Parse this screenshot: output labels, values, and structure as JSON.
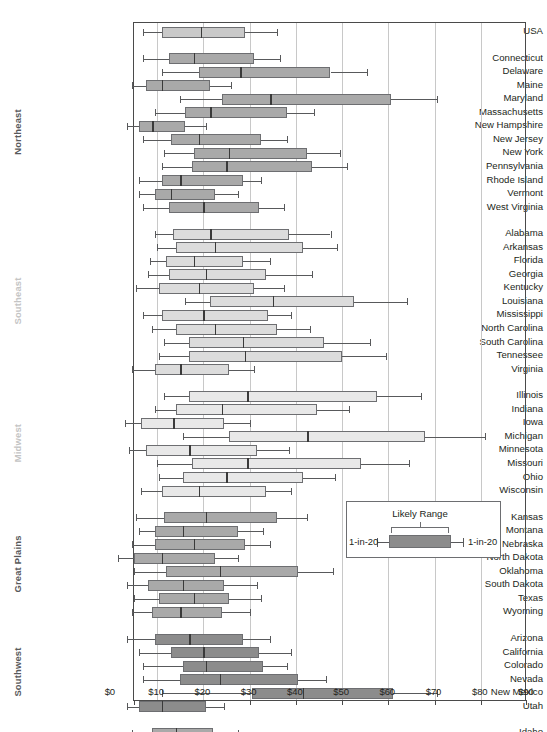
{
  "chart_data": {
    "type": "box",
    "title": "",
    "xlabel": "",
    "ylabel": "",
    "xlim": [
      0,
      90
    ],
    "xtick_labels": [
      "$0",
      "$10",
      "$20",
      "$30",
      "$40",
      "$50",
      "$60",
      "$70",
      "$80",
      "$90"
    ],
    "xtick_values": [
      0,
      10,
      20,
      30,
      40,
      50,
      60,
      70,
      80,
      90
    ],
    "grid": "vertical",
    "legend_position": "inside-right",
    "box_parts": [
      "1-in-20 low whisker",
      "Likely Range box",
      "median",
      "1-in-20 high whisker"
    ],
    "groups": [
      {
        "name": "",
        "label": "",
        "color": "#c9c9c9",
        "rows": [
          {
            "label": "USA",
            "low": 7.0,
            "q1": 11.0,
            "median": 19.5,
            "q3": 29.0,
            "high": 36.0
          }
        ]
      },
      {
        "name": "Northeast",
        "label": "Northeast",
        "color": "#a9a9a9",
        "rows": [
          {
            "label": "Connecticut",
            "low": 7.0,
            "q1": 12.5,
            "median": 18.0,
            "q3": 31.0,
            "high": 36.5
          },
          {
            "label": "Delaware",
            "low": 11.0,
            "q1": 19.0,
            "median": 28.0,
            "q3": 47.5,
            "high": 55.5
          },
          {
            "label": "Maine",
            "low": 4.5,
            "q1": 7.5,
            "median": 11.0,
            "q3": 21.5,
            "high": 26.0
          },
          {
            "label": "Maryland",
            "low": 15.0,
            "q1": 24.0,
            "median": 34.5,
            "q3": 60.5,
            "high": 70.5
          },
          {
            "label": "Massachusetts",
            "low": 9.5,
            "q1": 16.0,
            "median": 21.5,
            "q3": 38.0,
            "high": 44.0
          },
          {
            "label": "New Hampshire",
            "low": 3.5,
            "q1": 6.0,
            "median": 9.0,
            "q3": 16.0,
            "high": 20.5
          },
          {
            "label": "New Jersey",
            "low": 7.0,
            "q1": 13.0,
            "median": 19.0,
            "q3": 32.5,
            "high": 38.0
          },
          {
            "label": "New York",
            "low": 11.5,
            "q1": 18.0,
            "median": 25.5,
            "q3": 42.5,
            "high": 49.5
          },
          {
            "label": "Pennsylvania",
            "low": 11.0,
            "q1": 17.5,
            "median": 25.0,
            "q3": 43.5,
            "high": 51.0
          },
          {
            "label": "Rhode Island",
            "low": 6.0,
            "q1": 11.0,
            "median": 15.0,
            "q3": 28.5,
            "high": 32.5
          },
          {
            "label": "Vermont",
            "low": 6.0,
            "q1": 9.5,
            "median": 13.0,
            "q3": 22.5,
            "high": 27.5
          },
          {
            "label": "West Virginia",
            "low": 7.0,
            "q1": 12.5,
            "median": 20.0,
            "q3": 32.0,
            "high": 37.5
          }
        ]
      },
      {
        "name": "Southeast",
        "label": "Southeast",
        "color": "#dcdcdc",
        "rows": [
          {
            "label": "Alabama",
            "low": 9.5,
            "q1": 13.5,
            "median": 21.5,
            "q3": 38.5,
            "high": 47.5
          },
          {
            "label": "Arkansas",
            "low": 10.0,
            "q1": 14.0,
            "median": 22.5,
            "q3": 41.5,
            "high": 49.0
          },
          {
            "label": "Florida",
            "low": 8.5,
            "q1": 12.0,
            "median": 18.0,
            "q3": 28.5,
            "high": 34.5
          },
          {
            "label": "Georgia",
            "low": 8.0,
            "q1": 12.5,
            "median": 20.5,
            "q3": 33.5,
            "high": 43.5
          },
          {
            "label": "Kentucky",
            "low": 5.5,
            "q1": 10.5,
            "median": 19.0,
            "q3": 31.0,
            "high": 37.5
          },
          {
            "label": "Louisiana",
            "low": 16.0,
            "q1": 21.5,
            "median": 35.0,
            "q3": 52.5,
            "high": 64.0
          },
          {
            "label": "Mississippi",
            "low": 7.0,
            "q1": 11.0,
            "median": 20.0,
            "q3": 34.0,
            "high": 39.0
          },
          {
            "label": "North Carolina",
            "low": 9.0,
            "q1": 14.0,
            "median": 22.5,
            "q3": 36.0,
            "high": 43.0
          },
          {
            "label": "South Carolina",
            "low": 11.5,
            "q1": 17.0,
            "median": 28.5,
            "q3": 46.0,
            "high": 56.0
          },
          {
            "label": "Tennessee",
            "low": 10.5,
            "q1": 17.0,
            "median": 29.0,
            "q3": 50.0,
            "high": 59.5
          },
          {
            "label": "Virginia",
            "low": 4.5,
            "q1": 9.5,
            "median": 15.0,
            "q3": 25.5,
            "high": 31.0
          }
        ]
      },
      {
        "name": "Midwest",
        "label": "Midwest",
        "color": "#e8e8e8",
        "rows": [
          {
            "label": "Illinois",
            "low": 11.5,
            "q1": 17.0,
            "median": 29.5,
            "q3": 57.5,
            "high": 67.0
          },
          {
            "label": "Indiana",
            "low": 9.5,
            "q1": 14.0,
            "median": 24.0,
            "q3": 44.5,
            "high": 51.5
          },
          {
            "label": "Iowa",
            "low": 3.0,
            "q1": 6.5,
            "median": 13.5,
            "q3": 24.5,
            "high": 30.0
          },
          {
            "label": "Michigan",
            "low": 15.5,
            "q1": 25.5,
            "median": 42.5,
            "q3": 68.0,
            "high": 81.0
          },
          {
            "label": "Minnesota",
            "low": 4.0,
            "q1": 7.5,
            "median": 17.0,
            "q3": 31.5,
            "high": 38.5
          },
          {
            "label": "Missouri",
            "low": 10.0,
            "q1": 17.5,
            "median": 29.5,
            "q3": 54.0,
            "high": 64.5
          },
          {
            "label": "Ohio",
            "low": 10.5,
            "q1": 15.5,
            "median": 25.0,
            "q3": 41.5,
            "high": 48.5
          },
          {
            "label": "Wisconsin",
            "low": 6.5,
            "q1": 11.0,
            "median": 19.0,
            "q3": 33.5,
            "high": 39.0
          }
        ]
      },
      {
        "name": "Great Plains",
        "label": "Great Plains",
        "color": "#a9a9a9",
        "rows": [
          {
            "label": "Kansas",
            "low": 5.5,
            "q1": 11.5,
            "median": 20.5,
            "q3": 36.0,
            "high": 42.5
          },
          {
            "label": "Montana",
            "low": 6.0,
            "q1": 9.5,
            "median": 15.5,
            "q3": 27.5,
            "high": 33.0
          },
          {
            "label": "Nebraska",
            "low": 4.5,
            "q1": 9.5,
            "median": 18.0,
            "q3": 29.0,
            "high": 34.5
          },
          {
            "label": "North Dakota",
            "low": 1.5,
            "q1": 5.0,
            "median": 11.0,
            "q3": 22.5,
            "high": 27.5
          },
          {
            "label": "Oklahoma",
            "low": 5.0,
            "q1": 12.0,
            "median": 23.5,
            "q3": 40.5,
            "high": 48.0
          },
          {
            "label": "South Dakota",
            "low": 3.5,
            "q1": 8.0,
            "median": 15.5,
            "q3": 24.5,
            "high": 31.5
          },
          {
            "label": "Texas",
            "low": 5.0,
            "q1": 10.5,
            "median": 18.0,
            "q3": 25.5,
            "high": 32.5
          },
          {
            "label": "Wyoming",
            "low": 4.5,
            "q1": 9.0,
            "median": 15.0,
            "q3": 24.0,
            "high": 30.0
          }
        ]
      },
      {
        "name": "Southwest",
        "label": "Southwest",
        "color": "#8c8c8c",
        "rows": [
          {
            "label": "Arizona",
            "low": 3.5,
            "q1": 9.5,
            "median": 17.0,
            "q3": 28.5,
            "high": 34.5
          },
          {
            "label": "California",
            "low": 6.0,
            "q1": 13.0,
            "median": 20.0,
            "q3": 32.0,
            "high": 39.0
          },
          {
            "label": "Colorado",
            "low": 7.0,
            "q1": 15.5,
            "median": 20.5,
            "q3": 33.0,
            "high": 38.0
          },
          {
            "label": "Nevada",
            "low": 7.0,
            "q1": 15.0,
            "median": 23.5,
            "q3": 40.5,
            "high": 46.5
          },
          {
            "label": "New Mexico",
            "low": 11.0,
            "q1": 30.5,
            "median": 41.5,
            "q3": 61.0,
            "high": 70.5
          },
          {
            "label": "Utah",
            "low": 3.5,
            "q1": 6.0,
            "median": 11.0,
            "q3": 20.5,
            "high": 24.5
          }
        ]
      },
      {
        "name": "NW",
        "label": "NW",
        "color": "#a9a9a9",
        "rows": [
          {
            "label": "Idaho",
            "low": 4.5,
            "q1": 9.0,
            "median": 14.0,
            "q3": 22.0,
            "high": 27.5
          },
          {
            "label": "Oregon",
            "low": 2.0,
            "q1": 8.0,
            "median": 12.5,
            "q3": 18.5,
            "high": 24.0
          },
          {
            "label": "Washington",
            "low": 4.5,
            "q1": 10.0,
            "median": 17.0,
            "q3": 26.5,
            "high": 32.0
          }
        ]
      }
    ]
  },
  "legend": {
    "title": "Likely Range",
    "left_label": "1-in-20",
    "right_label": "1-in-20",
    "box_color": "#8c8c8c"
  }
}
